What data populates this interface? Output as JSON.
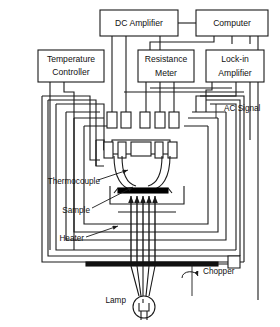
{
  "figure": {
    "type": "apparatus-block-diagram"
  },
  "instruments": [
    {
      "id": "dc-amplifier",
      "label": "DC Amplifier",
      "lines": [
        "DC Amplifier"
      ],
      "x": 100,
      "y": 10,
      "w": 78,
      "h": 26
    },
    {
      "id": "computer",
      "label": "Computer",
      "lines": [
        "Computer"
      ],
      "x": 196,
      "y": 10,
      "w": 72,
      "h": 26
    },
    {
      "id": "temperature-controller",
      "label": "Temperature Controller",
      "lines": [
        "Temperature",
        "Controller"
      ],
      "x": 38,
      "y": 50,
      "w": 66,
      "h": 32
    },
    {
      "id": "resistance-meter",
      "label": "Resistance Meter",
      "lines": [
        "Resistance",
        "Meter"
      ],
      "x": 138,
      "y": 50,
      "w": 56,
      "h": 32
    },
    {
      "id": "lock-in-amplifier",
      "label": "Lock-in Amplifier",
      "lines": [
        "Lock-in",
        "Amplifier"
      ],
      "x": 206,
      "y": 50,
      "w": 58,
      "h": 32
    }
  ],
  "annotations": [
    {
      "id": "ac-signal",
      "label": "AC Signal",
      "x": 224,
      "y": 109,
      "anchor": "start"
    },
    {
      "id": "thermocouple",
      "label": "Thermocouple",
      "x": 60,
      "y": 182,
      "anchor": "end"
    },
    {
      "id": "sample",
      "label": "Sample",
      "x": 60,
      "y": 211,
      "anchor": "end"
    },
    {
      "id": "heater",
      "label": "Heater",
      "x": 60,
      "y": 239,
      "anchor": "end"
    },
    {
      "id": "chopper",
      "label": "Chopper",
      "x": 203,
      "y": 272,
      "anchor": "start"
    },
    {
      "id": "lamp",
      "label": "Lamp",
      "x": 143,
      "y": 300,
      "anchor": "end"
    }
  ],
  "components": {
    "sample_holder": "crucible-shaped sample holder with heater block",
    "light_beam": "five converging light-ray arrows from lamp to sample",
    "chopper_wheel": "horizontal chopper blade with rotation arrow",
    "lamp_bulb": "circular lamp with filament",
    "chamber": "nested rectangular vacuum chamber / shield walls"
  },
  "colors": {
    "stroke": "#1a1a1a",
    "background": "#ffffff",
    "sample_fill": "#000000"
  }
}
